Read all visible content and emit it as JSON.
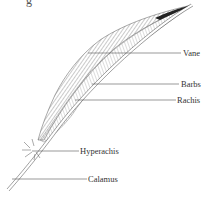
{
  "figure": {
    "title_fragment": "g",
    "labels": [
      {
        "id": "vane",
        "text": "Vane",
        "x": 183,
        "y": 48
      },
      {
        "id": "barbs",
        "text": "Barbs",
        "x": 181,
        "y": 79
      },
      {
        "id": "rachis",
        "text": "Rachis",
        "x": 177,
        "y": 95
      },
      {
        "id": "hyperachis",
        "text": "Hyperachis",
        "x": 80,
        "y": 146
      },
      {
        "id": "calamus",
        "text": "Calamus",
        "x": 88,
        "y": 174
      }
    ],
    "colors": {
      "ink": "#333333",
      "leader": "#555555",
      "background": "#ffffff"
    }
  }
}
